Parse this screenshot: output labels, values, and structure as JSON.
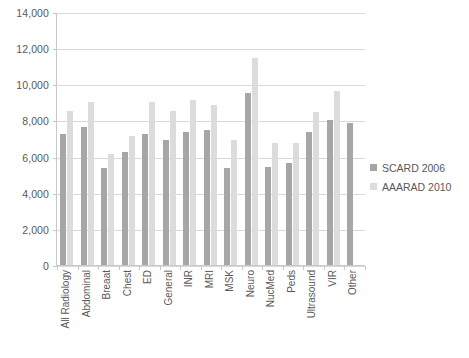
{
  "chart_data": {
    "type": "bar",
    "title": "",
    "subtitle": "",
    "xlabel": "",
    "ylabel": "",
    "ylim": [
      0,
      14000
    ],
    "ytick_values": [
      0,
      2000,
      4000,
      6000,
      8000,
      10000,
      12000,
      14000
    ],
    "ytick_labels": [
      "0",
      "2,000",
      "4,000",
      "6,000",
      "8,000",
      "10,000",
      "12,000",
      "14,000"
    ],
    "grid": true,
    "legend_position": "right",
    "categories": [
      "All Radiology",
      "Abdominal",
      "Breaat",
      "Chest",
      "ED",
      "General",
      "INR",
      "MRI",
      "MSK",
      "Neuro",
      "NucMed",
      "Peds",
      "Ultrasound",
      "VIR",
      "Other"
    ],
    "series": [
      {
        "name": "SCARD 2006",
        "color": "#a6a6a6",
        "values": [
          7300,
          7700,
          5400,
          6300,
          7300,
          7000,
          7400,
          7500,
          5400,
          9600,
          5500,
          5700,
          7400,
          8100,
          7900
        ]
      },
      {
        "name": "AAARAD 2010",
        "color": "#dcdcdc",
        "values": [
          8600,
          9100,
          6200,
          7200,
          9100,
          8600,
          9200,
          8900,
          7000,
          11500,
          6800,
          6800,
          8500,
          9700,
          0
        ]
      }
    ]
  },
  "legend": {
    "items": [
      {
        "label": "SCARD 2006",
        "color": "#a6a6a6"
      },
      {
        "label": "AAARAD 2010",
        "color": "#dcdcdc"
      }
    ]
  }
}
